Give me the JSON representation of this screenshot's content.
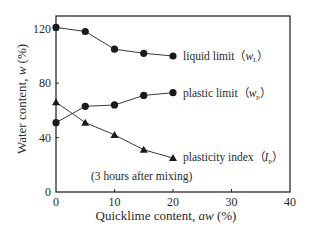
{
  "chart_data": {
    "type": "line",
    "title": "",
    "xlabel": "Quicklime content, aw (%)",
    "ylabel": "Water content, w (%)",
    "xlim": [
      0,
      40
    ],
    "ylim": [
      0,
      130
    ],
    "xticks": [
      0,
      10,
      20,
      30,
      40
    ],
    "yticks": [
      0,
      40,
      80,
      120
    ],
    "grid": false,
    "legend_position": "inline labels at right end of each series",
    "annotation": "(3 hours after mixing)",
    "x": [
      0,
      5,
      10,
      15,
      20
    ],
    "series": [
      {
        "name": "liquid limit",
        "symbol": "wL",
        "marker": "circle",
        "values": [
          121,
          118,
          105,
          102,
          100
        ]
      },
      {
        "name": "plastic limit",
        "symbol": "wp",
        "marker": "circle",
        "values": [
          51,
          63,
          64,
          71,
          73
        ]
      },
      {
        "name": "plasticity index",
        "symbol": "Ip",
        "marker": "triangle",
        "values": [
          66,
          51,
          42,
          31,
          25
        ]
      }
    ]
  },
  "labels": {
    "xlabel_main": "Quicklime content, ",
    "xlabel_italic": "aw",
    "xlabel_unit": " (%)",
    "ylabel_main": "Water content, ",
    "ylabel_italic": "w",
    "ylabel_unit": " (%)",
    "series": [
      {
        "text": "liquid limit（",
        "var": "w",
        "sub": "L",
        "close": "）"
      },
      {
        "text": "plastic limit（",
        "var": "w",
        "sub": "p",
        "close": "）"
      },
      {
        "text": "plasticity index（",
        "var": "I",
        "sub": "p",
        "close": "）"
      }
    ],
    "note": "(3 hours after mixing)"
  },
  "colors": {
    "line": "#3a3a3a",
    "marker": "#1a1a1a",
    "frame": "#2a2a2a",
    "text": "#2a2a2a",
    "background": "#ffffff"
  }
}
